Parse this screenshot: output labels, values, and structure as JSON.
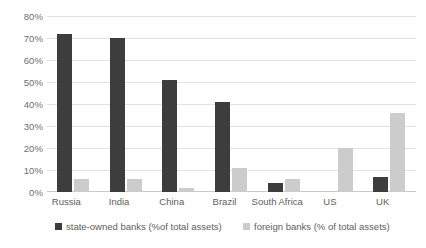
{
  "chart_data": {
    "type": "bar",
    "title": "",
    "xlabel": "",
    "ylabel": "",
    "ylim": [
      0,
      80
    ],
    "ytick_step": 10,
    "grid": true,
    "legend_position": "bottom",
    "categories": [
      "Russia",
      "India",
      "China",
      "Brazil",
      "South Africa",
      "US",
      "UK"
    ],
    "ytick_labels": [
      "80%",
      "70%",
      "60%",
      "50%",
      "40%",
      "30%",
      "20%",
      "10%",
      "0%"
    ],
    "ytick_values": [
      80,
      70,
      60,
      50,
      40,
      30,
      20,
      10,
      0
    ],
    "series": [
      {
        "name": "state-owned banks (%of total assets)",
        "color": "#3d3d3d",
        "values": [
          72,
          70,
          51,
          41,
          4,
          0,
          7
        ]
      },
      {
        "name": "foreign banks (% of total assets)",
        "color": "#cccccc",
        "values": [
          6,
          6,
          2,
          11,
          6,
          20,
          36
        ]
      }
    ]
  },
  "legend": {
    "items": [
      {
        "label": "state-owned banks (%of total assets)",
        "color": "#3d3d3d"
      },
      {
        "label": "foreign banks (% of total assets)",
        "color": "#cccccc"
      }
    ]
  },
  "colors": {
    "state_bar": "#3d3d3d",
    "foreign_bar": "#cccccc",
    "gridline": "#e2e2e2",
    "axis": "#c9c9c9",
    "text": "#5e5e5e",
    "background": "#ffffff"
  }
}
